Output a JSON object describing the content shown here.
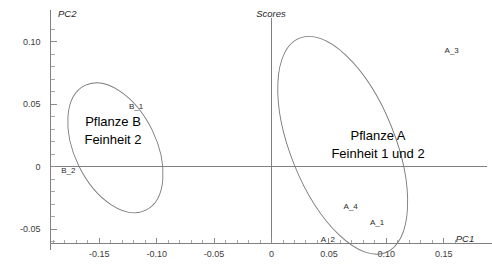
{
  "chart_data": {
    "type": "scatter",
    "title": "Scores",
    "xlabel": "PC1",
    "ylabel": "PC2",
    "xlim": [
      -0.175,
      0.16
    ],
    "ylim": [
      -0.062,
      0.118
    ],
    "xticks": [
      -0.15,
      -0.1,
      -0.05,
      0,
      0.05,
      0.1,
      0.15
    ],
    "xticklabels": [
      "-0.15",
      "-0.10",
      "-0.05",
      "0",
      "0.05",
      "0.10",
      "0.15"
    ],
    "yticks": [
      -0.05,
      0,
      0.05,
      0.1
    ],
    "yticklabels": [
      "-0.05",
      "0",
      "0.05",
      "0.10"
    ],
    "minor_tick_step_x": 0.01,
    "minor_tick_step_y": 0.01,
    "grid": false,
    "legend": "none",
    "points": [
      {
        "label": "B_1",
        "x": -0.118,
        "y": 0.046
      },
      {
        "label": "B_2",
        "x": -0.177,
        "y": -0.005
      },
      {
        "label": "A_3",
        "x": 0.157,
        "y": 0.091
      },
      {
        "label": "A_4",
        "x": 0.069,
        "y": -0.034
      },
      {
        "label": "A_1",
        "x": 0.092,
        "y": -0.047
      },
      {
        "label": "A_2",
        "x": 0.049,
        "y": -0.06
      }
    ],
    "groups": [
      {
        "name": "Pflanze B",
        "lines": [
          "Pflanze B",
          "Feinheit 2"
        ],
        "members": [
          "B_1",
          "B_2"
        ],
        "ellipse": {
          "cx": -0.136,
          "cy": 0.015,
          "rx": 0.0355,
          "ry": 0.0555,
          "rotation_deg": -26
        }
      },
      {
        "name": "Pflanze A",
        "lines": [
          "Pflanze A",
          "Feinheit 1 und 2"
        ],
        "members": [
          "A_1",
          "A_2",
          "A_3",
          "A_4"
        ],
        "ellipse": {
          "cx": 0.062,
          "cy": 0.017,
          "rx": 0.0455,
          "ry": 0.0925,
          "rotation_deg": -22
        }
      }
    ],
    "colors": {
      "background": "#ffffff",
      "axis": "#808080",
      "ellipse": "#7a7a7a",
      "text": "#1a1a1a"
    }
  }
}
